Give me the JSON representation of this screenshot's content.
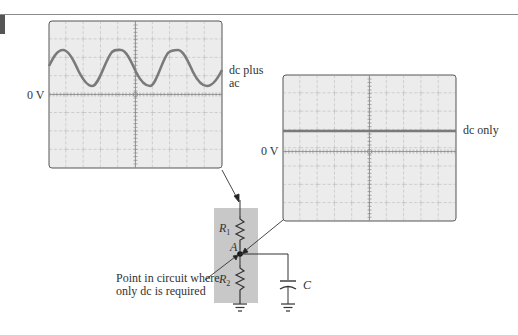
{
  "scope_ac": {
    "trace_label_line1": "dc plus",
    "trace_label_line2": "ac",
    "zero_label": "0 V"
  },
  "scope_dc": {
    "trace_label": "dc only",
    "zero_label": "0 V"
  },
  "circuit": {
    "r1_label": "R",
    "r1_sub": "1",
    "r2_label": "R",
    "r2_sub": "2",
    "node_label": "A",
    "cap_label": "C",
    "annotation_line1": "Point in circuit where",
    "annotation_line2": "only dc is required"
  },
  "colors": {
    "screen": "#ececec",
    "trace": "#7a7a7a",
    "grid": "#9a9a9a",
    "highlight": "#c8c8c8"
  }
}
